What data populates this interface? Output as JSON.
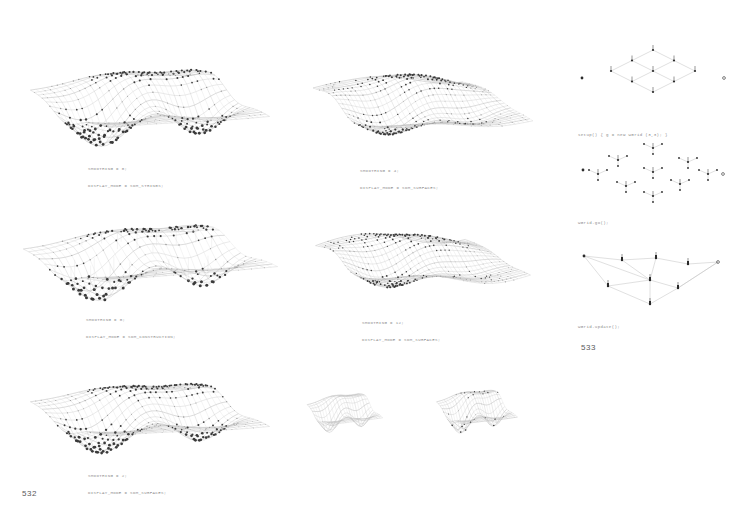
{
  "document": {
    "type": "book-spread",
    "background_color": "#ffffff",
    "caption_color": "#8c8c8c",
    "node_color": "#3a3a3a",
    "mesh_color": "#b9b9b9"
  },
  "folios": {
    "left": "532",
    "right": "533"
  },
  "figures": [
    {
      "id": "fig-top-left",
      "name": "surface-mesh-smoothing-0-strings",
      "caption": [
        "SMOOTHING = 0;",
        "DISPLAY_MODE = SDM_STRINGS;"
      ],
      "style": "strings",
      "smoothing": 0,
      "display_mode": "SDM_STRINGS",
      "grid_u": 22,
      "grid_v": 16
    },
    {
      "id": "fig-top-mid",
      "name": "surface-mesh-smoothing-4-surfaces",
      "caption": [
        "SMOOTHING = 4;",
        "DISPLAY_MODE = SDM_SURFACES;"
      ],
      "style": "surfaces",
      "smoothing": 4,
      "display_mode": "SDM_SURFACES",
      "grid_u": 24,
      "grid_v": 17
    },
    {
      "id": "fig-mid-left",
      "name": "surface-mesh-smoothing-0-construction",
      "caption": [
        "SMOOTHING = 0;",
        "DISPLAY_MODE = SDM_CONSTRUCTION;"
      ],
      "style": "construction",
      "smoothing": 0,
      "display_mode": "SDM_CONSTRUCTION",
      "grid_u": 20,
      "grid_v": 13
    },
    {
      "id": "fig-mid-mid",
      "name": "surface-mesh-smoothing-12-surfaces",
      "caption": [
        "SMOOTHING = 12;",
        "DISPLAY_MODE = SDM_SURFACES;"
      ],
      "style": "surfaces",
      "smoothing": 12,
      "display_mode": "SDM_SURFACES",
      "grid_u": 26,
      "grid_v": 18
    },
    {
      "id": "fig-bot-left",
      "name": "surface-mesh-smoothing-2-surfaces",
      "caption": [
        "SMOOTHING = 2;",
        "DISPLAY_MODE = SDM_SURFACES;"
      ],
      "style": "surfaces",
      "smoothing": 2,
      "display_mode": "SDM_SURFACES",
      "grid_u": 22,
      "grid_v": 16
    },
    {
      "id": "fig-bot-thumb-a",
      "name": "surface-thumbnail-a",
      "caption": [],
      "style": "thumb",
      "grid_u": 18,
      "grid_v": 12
    },
    {
      "id": "fig-bot-thumb-b",
      "name": "surface-thumbnail-b",
      "caption": [],
      "style": "thumb",
      "grid_u": 18,
      "grid_v": 12
    }
  ],
  "diagrams": [
    {
      "id": "diag-grid",
      "name": "wgrid-construction-diagram",
      "caption": [
        "setup() { g = new WGrid (3,3); }"
      ],
      "kind": "lattice",
      "rows": 3,
      "cols": 3
    },
    {
      "id": "diag-exploded",
      "name": "wgrid-go-diagram",
      "caption": [
        "WGrid.go();"
      ],
      "kind": "exploded",
      "clusters": 8
    },
    {
      "id": "diag-update",
      "name": "wgrid-update-diagram",
      "caption": [
        "WGrid.update();"
      ],
      "kind": "connected",
      "nodes": 9
    }
  ]
}
